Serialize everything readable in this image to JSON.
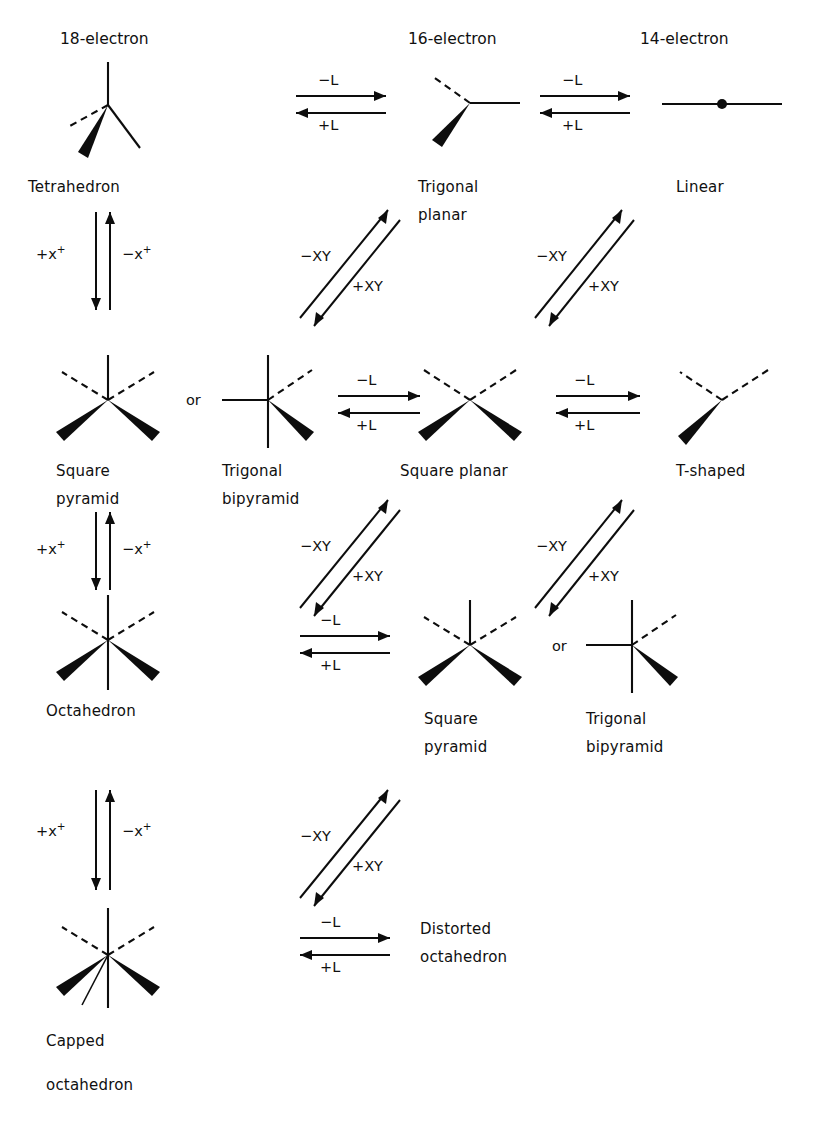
{
  "figure": {
    "type": "reaction-scheme",
    "title_headers": [
      {
        "label": "18-electron",
        "x": 60,
        "y": 30
      },
      {
        "label": "16-electron",
        "x": 408,
        "y": 30
      },
      {
        "label": "14-electron",
        "x": 640,
        "y": 30
      }
    ]
  },
  "structures": [
    {
      "id": "tetrahedron",
      "label": "Tetrahedron",
      "label2": "",
      "x": 115,
      "y": 112
    },
    {
      "id": "trigonal-planar",
      "label": "Trigonal",
      "label2": "planar",
      "x": 470,
      "y": 112
    },
    {
      "id": "linear",
      "label": "Linear",
      "label2": "",
      "x": 718,
      "y": 112
    },
    {
      "id": "square-pyramid-1",
      "label": "Square",
      "label2": "pyramid",
      "x": 108,
      "y": 412
    },
    {
      "id": "trigonal-bipyramid-1",
      "label": "Trigonal",
      "label2": "bipyramid",
      "x": 265,
      "y": 412
    },
    {
      "id": "square-planar",
      "label": "Square planar",
      "label2": "",
      "x": 470,
      "y": 412
    },
    {
      "id": "t-shaped",
      "label": "T-shaped",
      "label2": "",
      "x": 718,
      "y": 412
    },
    {
      "id": "octahedron",
      "label": "Octahedron",
      "label2": "",
      "x": 108,
      "y": 650
    },
    {
      "id": "square-pyramid-2",
      "label": "Square",
      "label2": "pyramid",
      "x": 470,
      "y": 655
    },
    {
      "id": "trigonal-bipyramid-2",
      "label": "Trigonal",
      "label2": "bipyramid",
      "x": 630,
      "y": 655
    },
    {
      "id": "capped-octahedron",
      "label": "Capped",
      "label2": "octahedron",
      "x": 108,
      "y": 965
    }
  ],
  "structure_labels": {
    "tetrahedron": "Tetrahedron",
    "trigonal_planar_line1": "Trigonal",
    "trigonal_planar_line2": "planar",
    "linear": "Linear",
    "square_pyramid_line1": "Square",
    "square_pyramid_line2": "pyramid",
    "trigonal_bipyramid_line1": "Trigonal",
    "trigonal_bipyramid_line2": "bipyramid",
    "square_planar": "Square planar",
    "t_shaped": "T-shaped",
    "octahedron": "Octahedron",
    "square_pyramid2_line1": "Square",
    "square_pyramid2_line2": "pyramid",
    "trigonal_bipyramid2_line1": "Trigonal",
    "trigonal_bipyramid2_line2": "bipyramid",
    "capped_line1": "Capped",
    "capped_line2": "octahedron",
    "distorted_line1": "Distorted",
    "distorted_line2": "octahedron",
    "or_1": "or",
    "or_2": "or"
  },
  "arrow_labels": {
    "minus_L": "−L",
    "plus_L": "+L",
    "minus_XY": "−XY",
    "plus_XY": "+XY",
    "plus_x_base": "+x",
    "minus_x_base": "−x",
    "x_superscript": "+"
  },
  "arrows": {
    "horizontal": [
      {
        "id": "h1",
        "top_label": "−L",
        "bottom_label": "+L",
        "x": 300,
        "y": 98
      },
      {
        "id": "h2",
        "top_label": "−L",
        "bottom_label": "+L",
        "x": 540,
        "y": 98
      },
      {
        "id": "h3",
        "top_label": "−L",
        "bottom_label": "+L",
        "x": 302,
        "y": 408
      },
      {
        "id": "h4",
        "top_label": "−L",
        "bottom_label": "+L",
        "x": 540,
        "y": 408
      },
      {
        "id": "h5",
        "top_label": "−L",
        "bottom_label": "+L",
        "x": 302,
        "y": 648
      },
      {
        "id": "h6",
        "top_label": "−L",
        "bottom_label": "+L",
        "x": 302,
        "y": 945
      }
    ],
    "vertical": [
      {
        "id": "v1",
        "left_label": "+x+",
        "right_label": "−x+",
        "x": 118,
        "y": 235
      },
      {
        "id": "v2",
        "left_label": "+x+",
        "right_label": "−x+",
        "x": 118,
        "y": 530
      },
      {
        "id": "v3",
        "left_label": "+x+",
        "right_label": "−x+",
        "x": 118,
        "y": 805
      }
    ],
    "diagonal": [
      {
        "id": "d1",
        "upper_label": "−XY",
        "lower_label": "+XY",
        "x": 300,
        "y": 210
      },
      {
        "id": "d2",
        "upper_label": "−XY",
        "lower_label": "+XY",
        "x": 525,
        "y": 210
      },
      {
        "id": "d3",
        "upper_label": "−XY",
        "lower_label": "+XY",
        "x": 300,
        "y": 520
      },
      {
        "id": "d4",
        "upper_label": "−XY",
        "lower_label": "+XY",
        "x": 525,
        "y": 520
      },
      {
        "id": "d5",
        "upper_label": "−XY",
        "lower_label": "+XY",
        "x": 300,
        "y": 800
      }
    ]
  },
  "colors": {
    "ink": "#0d0d0d",
    "background": "#ffffff"
  }
}
